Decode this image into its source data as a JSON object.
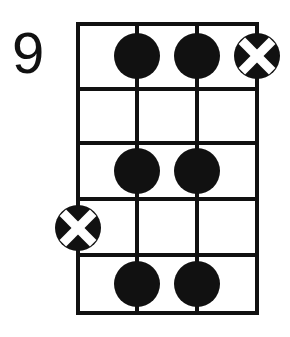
{
  "diagram": {
    "kind": "guitar-chord-diagram",
    "position_label": "9",
    "title": "",
    "colors": {
      "ink": "#111111",
      "paper": "#ffffff",
      "dot_fill": "#111111",
      "x_circle_fill": "#111111",
      "x_stroke": "#ffffff"
    },
    "grid": {
      "strings": 4,
      "frets": 5,
      "string_x": [
        78,
        137,
        197,
        257
      ],
      "fret_y": [
        24,
        89,
        143,
        199,
        255,
        313
      ],
      "left": 78,
      "right": 257,
      "top": 24,
      "bottom": 313,
      "line_width": 4,
      "string_labels": [
        "1",
        "2",
        "3",
        "4"
      ],
      "fret_labels": [
        "1",
        "2",
        "3",
        "4",
        "5"
      ]
    },
    "markers": [
      {
        "type": "dot",
        "string": 2,
        "fret": 1,
        "cx": 137,
        "cy": 56,
        "r": 23,
        "label": "finger-dot"
      },
      {
        "type": "dot",
        "string": 3,
        "fret": 1,
        "cx": 197,
        "cy": 56,
        "r": 23,
        "label": "finger-dot"
      },
      {
        "type": "x",
        "string": 4,
        "fret": 1,
        "cx": 257,
        "cy": 56,
        "r": 23,
        "label": "muted-x"
      },
      {
        "type": "dot",
        "string": 2,
        "fret": 3,
        "cx": 137,
        "cy": 171,
        "r": 23,
        "label": "finger-dot"
      },
      {
        "type": "dot",
        "string": 3,
        "fret": 3,
        "cx": 197,
        "cy": 171,
        "r": 23,
        "label": "finger-dot"
      },
      {
        "type": "x",
        "string": 1,
        "fret": 4,
        "cx": 78,
        "cy": 228,
        "r": 23,
        "label": "muted-x"
      },
      {
        "type": "dot",
        "string": 2,
        "fret": 5,
        "cx": 137,
        "cy": 284,
        "r": 23,
        "label": "finger-dot"
      },
      {
        "type": "dot",
        "string": 3,
        "fret": 5,
        "cx": 197,
        "cy": 284,
        "r": 23,
        "label": "finger-dot"
      }
    ]
  }
}
